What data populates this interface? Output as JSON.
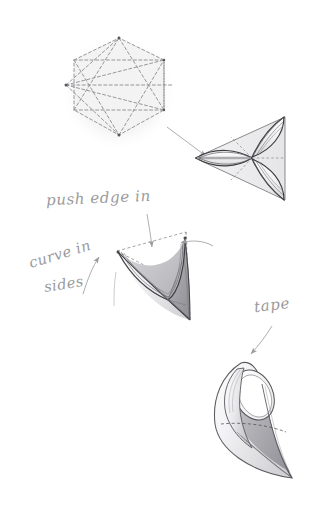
{
  "document": {
    "title": "Folding instruction diagram",
    "background_color": "#ffffff",
    "width": 312,
    "height": 530
  },
  "palette": {
    "dashed_line": "#8c8c8e",
    "ink_line": "#3a3a3c",
    "soft_line": "#b9b9bc",
    "handwriting": "#9a9a9c",
    "fill_light": "#f2f2f3",
    "fill_mid": "#d9d9dc",
    "fill_dark": "#a8a8ac",
    "fill_shadow": "#8e8e92",
    "halo": "#f4f4f5"
  },
  "annotations": [
    {
      "id": "push-edge-in",
      "text": "push edge in",
      "style": "handwritten-cursive"
    },
    {
      "id": "curve-in",
      "text": "curve in",
      "style": "handwritten-cursive"
    },
    {
      "id": "sides",
      "text": "sides",
      "style": "handwritten-cursive"
    },
    {
      "id": "tape",
      "text": "tape",
      "style": "handwritten-cursive"
    }
  ],
  "figures": [
    {
      "id": "step-1-hexagon",
      "name": "hexagon-template",
      "description": "Flat hexagon with dashed fold lines forming inscribed triangles and spokes",
      "center": [
        119,
        93
      ],
      "radius": 52
    },
    {
      "id": "step-2-triangle",
      "name": "folded-triangle",
      "description": "Triangle with three lens shaped petals radiating from centre",
      "apex": [
        200,
        158
      ],
      "top": [
        280,
        120
      ],
      "bottom": [
        280,
        200
      ]
    },
    {
      "id": "step-3-saddle",
      "name": "curved-saddle",
      "description": "Saddle shape with curved-in sides and dashed triangle guide",
      "left_tip": [
        118,
        252
      ],
      "right_tip": [
        184,
        238
      ],
      "bottom_tip": [
        190,
        320
      ]
    },
    {
      "id": "step-4-teardrop",
      "name": "taped-teardrop",
      "description": "Finished teardrop cone with ring opening at the top, taped seam",
      "top": [
        245,
        362
      ],
      "tip": [
        292,
        478
      ]
    }
  ],
  "arrows": [
    {
      "id": "arrow-hex-to-triangle",
      "from": [
        168,
        128
      ],
      "to": [
        207,
        158
      ],
      "style": "thin-line"
    },
    {
      "id": "arrow-push-edge-down",
      "from": [
        148,
        216
      ],
      "to": [
        152,
        248
      ],
      "style": "thin-line"
    },
    {
      "id": "arrow-curve-in-left",
      "from": [
        82,
        290
      ],
      "to": [
        98,
        258
      ],
      "style": "thin-line"
    },
    {
      "id": "arrow-curve-in-right",
      "from": [
        206,
        242
      ],
      "to": [
        180,
        244
      ],
      "style": "thin-line"
    },
    {
      "id": "arrow-tape-down",
      "from": [
        268,
        328
      ],
      "to": [
        252,
        352
      ],
      "style": "thin-line"
    }
  ]
}
